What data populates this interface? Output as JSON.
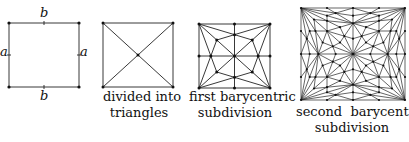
{
  "figure": {
    "panels": [
      {
        "id": "square",
        "caption_lines": [],
        "edge_labels": {
          "top": "b",
          "bottom": "b",
          "left": "a",
          "right": "a"
        }
      },
      {
        "id": "triangulated",
        "caption_lines": [
          "divided into",
          "triangles"
        ]
      },
      {
        "id": "first-barycentric",
        "caption_lines": [
          "first barycentric",
          "subdivision"
        ]
      },
      {
        "id": "second-barycentric",
        "caption_lines": [
          "second  barycentric",
          "subdivision"
        ]
      }
    ]
  }
}
